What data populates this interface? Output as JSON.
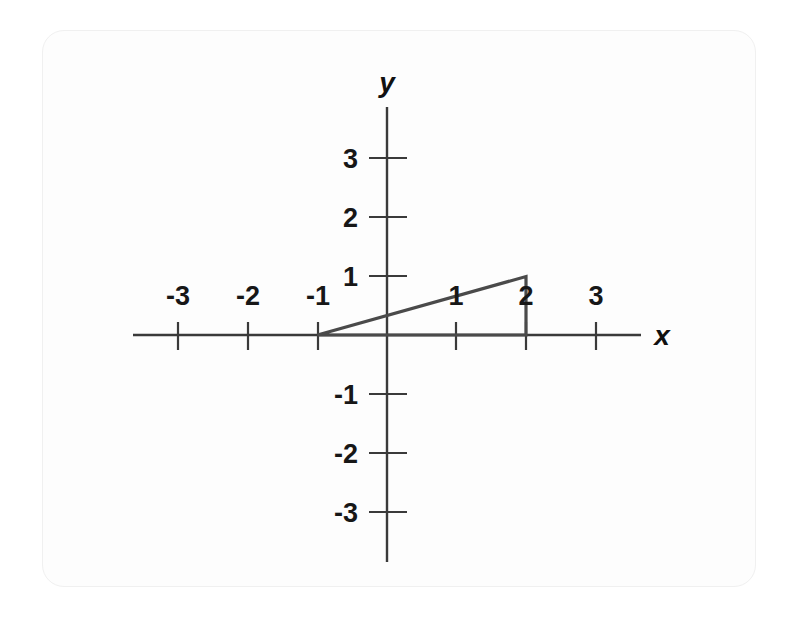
{
  "figure": {
    "kind": "cartesian-coordinate-plane",
    "background_color": "#ffffff",
    "card_color": "#fdfdfd",
    "line_color": "#3a3a3a",
    "shape_color": "#4a4a4a",
    "label_color": "#171717"
  },
  "axes": {
    "x_name": "x",
    "y_name": "y",
    "origin_px": {
      "x": 387,
      "y": 335
    },
    "unit_px": {
      "x": 69.5,
      "y": 58.5
    },
    "x_tick_labels": [
      "-3",
      "-2",
      "-1",
      "1",
      "2",
      "3"
    ],
    "y_tick_labels": [
      "3",
      "2",
      "1",
      "-1",
      "-2",
      "-3"
    ]
  },
  "chart_data": {
    "type": "line",
    "title": "",
    "subtitle": "",
    "xlabel": "x",
    "ylabel": "y",
    "xlim": [
      -3.7,
      3.8
    ],
    "ylim": [
      -3.8,
      3.9
    ],
    "grid": false,
    "legend": null,
    "x_ticks": [
      -3,
      -2,
      -1,
      1,
      2,
      3
    ],
    "y_ticks": [
      3,
      2,
      1,
      -1,
      -2,
      -3
    ],
    "x_tick_labels": [
      "-3",
      "-2",
      "-1",
      "1",
      "2",
      "3"
    ],
    "y_tick_labels": [
      "3",
      "2",
      "1",
      "-1",
      "-2",
      "-3"
    ],
    "annotations": [],
    "series": [
      {
        "name": "triangle",
        "type": "closed-polygon",
        "closed": true,
        "fill": "none",
        "stroke": "#4a4a4a",
        "points": [
          {
            "x": -1,
            "y": 0
          },
          {
            "x": 2,
            "y": 1
          },
          {
            "x": 2,
            "y": 0
          }
        ],
        "vertices_text": [
          "(-1, 0)",
          "(2, 1)",
          "(2, 0)"
        ]
      }
    ]
  }
}
